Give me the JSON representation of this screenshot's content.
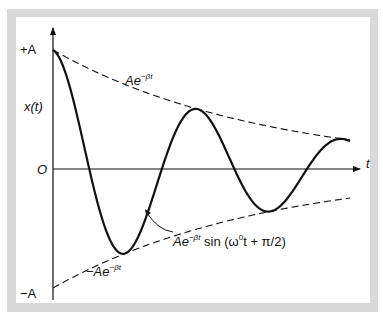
{
  "figure": {
    "type": "damped-oscillation-diagram",
    "y_axis": {
      "label": "x(t)",
      "ticks": [
        "+A",
        "O",
        "−A"
      ]
    },
    "x_axis": {
      "label": "t"
    },
    "annotations": {
      "upper_envelope": {
        "base": "Ae",
        "exp": "−βt"
      },
      "lower_envelope": {
        "base": "−Ae",
        "exp": "−βt"
      },
      "curve": {
        "base": "Ae",
        "exp": "−βt",
        "func_prefix": " sin (ω",
        "func_sup": "0",
        "func_suffix": "t + π/2)"
      }
    },
    "colors": {
      "frame": "#d9d9d9",
      "panel": "#ffffff",
      "ink": "#111111"
    },
    "model": {
      "origin_px": [
        53,
        169
      ],
      "amplitude_px": 119,
      "beta_per_px": 0.00475,
      "omega_per_px": 0.0433,
      "t_end_px": 297
    }
  }
}
